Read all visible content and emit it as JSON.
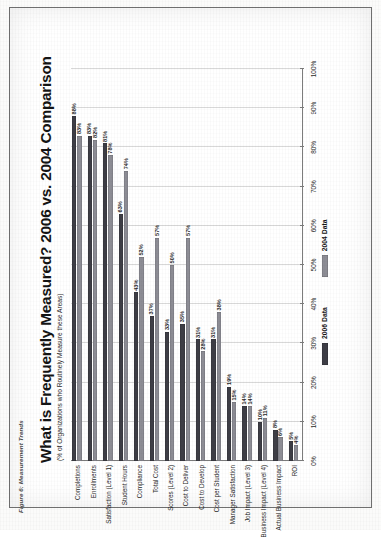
{
  "figure": {
    "caption": "Figure 6: Measurement Trends"
  },
  "chart_data": {
    "type": "bar",
    "title": "What is Frequently Measured?  2006 vs. 2004 Comparison",
    "subtitle": "(% of Organizations who Routinely Measure these Areas)",
    "orientation": "horizontal",
    "xlabel": "",
    "ylabel": "",
    "xlim": [
      0,
      100
    ],
    "xticks": [
      "0%",
      "10%",
      "20%",
      "30%",
      "40%",
      "50%",
      "60%",
      "70%",
      "80%",
      "90%",
      "100%"
    ],
    "xtick_values": [
      0,
      10,
      20,
      30,
      40,
      50,
      60,
      70,
      80,
      90,
      100
    ],
    "grid": true,
    "legend_position": "bottom",
    "categories": [
      "Completions",
      "Enrollments",
      "Satisfaction (Level 1)",
      "Student Hours",
      "Compliance",
      "Total Cost",
      "Scores (Level 2)",
      "Cost to Deliver",
      "Cost to Develop",
      "Cost per Student",
      "Manager Satisfaction",
      "Job Impact (Level 3)",
      "Business Impact (Level 4)",
      "Actual Business Impact",
      "ROI"
    ],
    "series": [
      {
        "name": "2006 Data",
        "color": "#3e3e46",
        "values": [
          88,
          83,
          81,
          63,
          43,
          37,
          33,
          35,
          31,
          31,
          19,
          14,
          10,
          8,
          5
        ],
        "labels": [
          "88%",
          "83%",
          "81%",
          "63%",
          "43%",
          "37%",
          "33%",
          "35%",
          "31%",
          "31%",
          "19%",
          "14%",
          "10%",
          "8%",
          "5%"
        ]
      },
      {
        "name": "2004 Data",
        "color": "#8d8d95",
        "values": [
          83,
          82,
          78,
          74,
          52,
          57,
          50,
          57,
          28,
          38,
          15,
          14,
          11,
          6,
          4
        ],
        "labels": [
          "83%",
          "82%",
          "78%",
          "74%",
          "52%",
          "57%",
          "50%",
          "57%",
          "28%",
          "38%",
          "15%",
          "14%",
          "11%",
          "6%",
          "4%"
        ]
      }
    ]
  },
  "legend": {
    "items": [
      {
        "label": "2006 Data"
      },
      {
        "label": "2004 Data"
      }
    ]
  }
}
